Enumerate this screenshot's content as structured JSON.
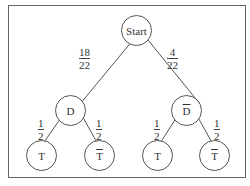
{
  "diagram": {
    "type": "probability-tree",
    "nodes": {
      "root": {
        "label": "Start"
      },
      "left": {
        "label": "D"
      },
      "right": {
        "label": "D",
        "overline": true
      },
      "leaf1": {
        "label": "T"
      },
      "leaf2": {
        "label": "T",
        "overline": true
      },
      "leaf3": {
        "label": "T"
      },
      "leaf4": {
        "label": "T",
        "overline": true
      }
    },
    "edges": {
      "root_left": {
        "num": "18",
        "den": "22"
      },
      "root_right": {
        "num": "4",
        "den": "22"
      },
      "left_leaf1": {
        "num": "1",
        "den": "2"
      },
      "left_leaf2": {
        "num": "1",
        "den": "2"
      },
      "right_leaf3": {
        "num": "1",
        "den": "2"
      },
      "right_leaf4": {
        "num": "1",
        "den": "2"
      }
    }
  }
}
